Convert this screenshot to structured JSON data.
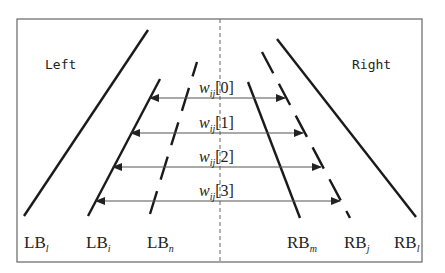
{
  "diagram": {
    "type": "lane-boundary-width-diagram",
    "frame": {
      "x1": 17,
      "y1": 19,
      "x2": 422,
      "y2": 262,
      "color": "#666666"
    },
    "center_line": {
      "x": 220,
      "style": "dashed",
      "color": "#666666"
    },
    "region_labels": {
      "left": "Left",
      "right": "Right"
    },
    "boundaries": [
      {
        "id": "LB_l",
        "base": "LB",
        "sub": "l",
        "style": "solid",
        "x1": 24,
        "y1": 216,
        "x2": 148,
        "y2": 30
      },
      {
        "id": "LB_i",
        "base": "LB",
        "sub": "i",
        "style": "solid",
        "x1": 88,
        "y1": 216,
        "x2": 160,
        "y2": 79
      },
      {
        "id": "LB_n",
        "base": "LB",
        "sub": "n",
        "style": "dashed",
        "x1": 150,
        "y1": 214,
        "x2": 197,
        "y2": 62
      },
      {
        "id": "RB_m",
        "base": "RB",
        "sub": "m",
        "style": "solid",
        "x1": 248,
        "y1": 82,
        "x2": 300,
        "y2": 218
      },
      {
        "id": "RB_j",
        "base": "RB",
        "sub": "j",
        "style": "dashed",
        "x1": 262,
        "y1": 52,
        "x2": 350,
        "y2": 218
      },
      {
        "id": "RB_l",
        "base": "RB",
        "sub": "l",
        "style": "solid",
        "x1": 277,
        "y1": 39,
        "x2": 416,
        "y2": 217
      }
    ],
    "boundary_labels": [
      {
        "text": "LB",
        "sub": "l",
        "x": 24,
        "y": 248
      },
      {
        "text": "LB",
        "sub": "i",
        "x": 86,
        "y": 248
      },
      {
        "text": "LB",
        "sub": "n",
        "x": 147,
        "y": 248
      },
      {
        "text": "RB",
        "sub": "m",
        "x": 287,
        "y": 248
      },
      {
        "text": "RB",
        "sub": "j",
        "x": 344,
        "y": 248
      },
      {
        "text": "RB",
        "sub": "l",
        "x": 394,
        "y": 248
      }
    ],
    "width_arrows": [
      {
        "label": "w",
        "sub": "ij",
        "index": "[0]",
        "y": 98,
        "x_left": 150,
        "x_right": 285
      },
      {
        "label": "w",
        "sub": "ij",
        "index": "[1]",
        "y": 133,
        "x_left": 131,
        "x_right": 303
      },
      {
        "label": "w",
        "sub": "ij",
        "index": "[2]",
        "y": 167,
        "x_left": 113,
        "x_right": 321
      },
      {
        "label": "w",
        "sub": "ij",
        "index": "[3]",
        "y": 201,
        "x_left": 96,
        "x_right": 340
      }
    ]
  }
}
